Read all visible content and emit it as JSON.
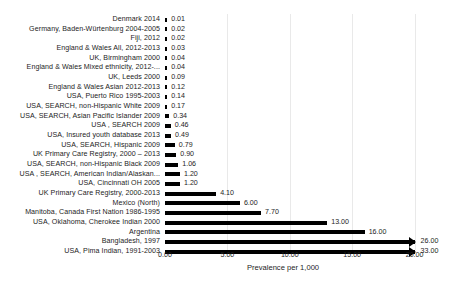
{
  "chart_data": {
    "type": "bar",
    "orientation": "horizontal",
    "title": "",
    "xlabel": "Prevalence per 1,000",
    "ylabel": "",
    "xlim": [
      0.0,
      20.0
    ],
    "xticks": [
      "0.00",
      "5.00",
      "10.00",
      "15.00",
      "20.00"
    ],
    "xtick_values": [
      0,
      5,
      10,
      15,
      20
    ],
    "grid": "vertical",
    "legend": "none",
    "bar_color": "#000000",
    "categories": [
      "Denmark 2014",
      "Germany, Baden-Würtenburg 2004-2005",
      "Fiji, 2012",
      "England & Wales All, 2012-2013",
      "UK, Birmingham 2000",
      "England & Wales Mixed ethnicity,  2012-...",
      "UK, Leeds 2000",
      "England & Wales Asian 2012-2013",
      "USA, Puerto Rico 1995-2003",
      "USA, SEARCH, non-Hispanic White 2009",
      "USA, SEARCH, Asian Pacific Islander 2009",
      "USA , SEARCH  2009",
      "USA, Insured youth database  2013",
      "USA, SEARCH, Hispanic 2009",
      "UK Primary Care Registry, 2000 – 2013",
      "USA, SEARCH, non-Hispanic Black  2009",
      "USA , SEARCH, American Indian/Alaskan...",
      "USA, Cincinnati OH 2005",
      "UK Primary Care Registry, 2000-2013",
      "Mexico (North)",
      "Manitoba, Canada First Nation 1986-1995",
      "USA, Oklahoma, Cherokee Indian 2000",
      "Argentina",
      "Bangladesh, 1997",
      "USA, Pima Indian, 1991-2003"
    ],
    "values": [
      0.01,
      0.02,
      0.02,
      0.03,
      0.04,
      0.04,
      0.09,
      0.12,
      0.14,
      0.17,
      0.34,
      0.46,
      0.49,
      0.79,
      0.9,
      1.06,
      1.2,
      1.2,
      4.1,
      6.0,
      7.7,
      13.0,
      16.0,
      26.0,
      33.0
    ],
    "value_labels": [
      "0.01",
      "0.02",
      "0.02",
      "0.03",
      "0.04",
      "0.04",
      "0.09",
      "0.12",
      "0.14",
      "0.17",
      "0.34",
      "0.46",
      "0.49",
      "0.79",
      "0.90",
      "1.06",
      "1.20",
      "1.20",
      "4.10",
      "6.00",
      "7.70",
      "13.00",
      "16.00",
      "26.00",
      "33.00"
    ],
    "off_scale_rows": [
      23,
      24
    ],
    "off_scale_note": "bars exceeding 20.00 are drawn truncated with an arrowhead"
  }
}
